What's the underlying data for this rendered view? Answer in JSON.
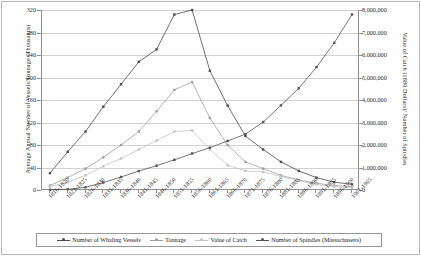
{
  "axes": {
    "left_title": "Average Annual Number of Vessels/Tonnage (Thousands)",
    "right_title": "Value of Catch (1880 Dollars)/ Number of Spindles",
    "left_ticks": [
      "0",
      "40",
      "80",
      "120",
      "160",
      "200",
      "240",
      "280",
      "320"
    ],
    "right_ticks": [
      "0",
      "1,000,000",
      "2,000,000",
      "3,000,000",
      "4,000,000",
      "5,000,000",
      "6,000,000",
      "7,000,000",
      "8,000,000"
    ]
  },
  "legend": {
    "items": [
      {
        "label": "Number of Whaling Vessels",
        "color": "#4d4d4d",
        "marker": "diamond-marker"
      },
      {
        "label": "Tonnage",
        "color": "#a0a0a0",
        "marker": "square-marker"
      },
      {
        "label": "Value of Catch",
        "color": "#c4c4c4",
        "marker": "triangle-marker"
      },
      {
        "label": "Number of Spindles (Massachusetts)",
        "color": "#555555",
        "marker": "square-marker"
      }
    ]
  },
  "chart_data": {
    "type": "line",
    "title": "",
    "xlabel": "",
    "ylabel": "Average Annual Number of Vessels/Tonnage (Thousands)",
    "y2label": "Value of Catch (1880 Dollars)/ Number of Spindles",
    "ylim": [
      0,
      320
    ],
    "y2lim": [
      0,
      8000000
    ],
    "grid": true,
    "legend_position": "bottom",
    "categories": [
      "1816-1820",
      "1821-1825",
      "1826-1830",
      "1831-1835",
      "1836-1840",
      "1841-1845",
      "1846-1850",
      "1851-1855",
      "1856-1860",
      "1861-1865",
      "1866-1870",
      "1871-1875",
      "1876-1880",
      "1881-1885",
      "1886-1890",
      "1891-1895",
      "1896-1900",
      "1901-1905"
    ],
    "series": [
      {
        "name": "Number of Whaling Vessels",
        "axis": "left",
        "color": "#4d4d4d",
        "values": [
          30,
          68,
          104,
          148,
          188,
          228,
          250,
          312,
          320,
          212,
          150,
          96,
          72,
          50,
          34,
          22,
          14,
          10
        ]
      },
      {
        "name": "Tonnage",
        "axis": "left",
        "color": "#a0a0a0",
        "values": [
          8,
          22,
          38,
          58,
          80,
          104,
          140,
          178,
          192,
          128,
          80,
          50,
          38,
          26,
          18,
          12,
          8,
          6
        ]
      },
      {
        "name": "Value of Catch",
        "axis": "left",
        "color": "#c4c4c4",
        "values": [
          6,
          14,
          26,
          42,
          56,
          72,
          88,
          104,
          106,
          72,
          44,
          34,
          32,
          24,
          16,
          10,
          6,
          4
        ]
      },
      {
        "name": "Number of Spindles (Massachusetts)",
        "axis": "right",
        "color": "#555555",
        "values": [
          10000,
          30000,
          120000,
          330000,
          580000,
          840000,
          1080000,
          1340000,
          1620000,
          1880000,
          2180000,
          2480000,
          3020000,
          3760000,
          4520000,
          5460000,
          6540000,
          7800000
        ]
      }
    ]
  }
}
